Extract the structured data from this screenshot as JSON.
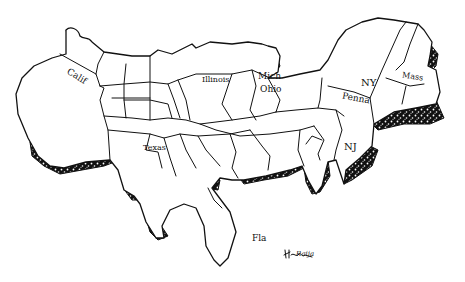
{
  "illustration": {
    "description": "Hand-drawn pen-and-ink cartogram of the United States with stippled coastal shadows",
    "ink_color": "#111111",
    "background_color": "#ffffff"
  },
  "labels": {
    "calif": "Calif",
    "illinois": "Illinois",
    "mich": "Mich",
    "ohio": "Ohio",
    "ny": "NY",
    "penna": "Penna",
    "mass": "Mass",
    "nj": "NJ",
    "texas": "Texas",
    "fla": "Fla"
  },
  "signature": "Raija"
}
